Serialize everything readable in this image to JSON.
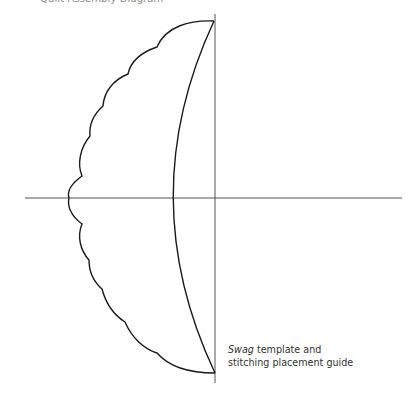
{
  "title": "Quilt Assembly Diagram",
  "caption": {
    "line1_italic": "Swag",
    "line1_rest": " template and",
    "line2": "stitching placement guide"
  },
  "colors": {
    "outline": "#1a1a1a",
    "axis": "#555555",
    "title": "#8a8a8a",
    "caption": "#333333"
  }
}
